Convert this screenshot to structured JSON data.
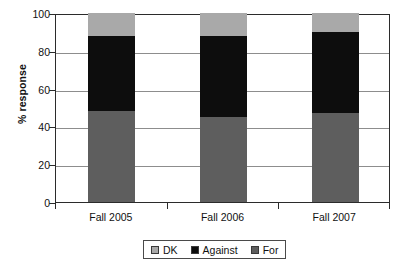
{
  "chart_data": {
    "type": "bar",
    "stacked": true,
    "title": "",
    "xlabel": "",
    "ylabel": "% response",
    "ylim": [
      0,
      100
    ],
    "yticks": [
      0,
      20,
      40,
      60,
      80,
      100
    ],
    "grid": true,
    "legend_position": "bottom",
    "categories": [
      "Fall 2005",
      "Fall 2006",
      "Fall 2007"
    ],
    "series": [
      {
        "name": "For",
        "color": "#5e5e5e",
        "values": [
          48,
          45,
          47
        ]
      },
      {
        "name": "Against",
        "color": "#0d0d0d",
        "values": [
          40,
          43,
          43
        ]
      },
      {
        "name": "DK",
        "color": "#a9a9a9",
        "values": [
          12,
          12,
          10
        ]
      }
    ],
    "stack_order_bottom_to_top": [
      "For",
      "Against",
      "DK"
    ]
  },
  "axes": {
    "y_title": "% response",
    "y_tick_labels": [
      "100",
      "80",
      "60",
      "40",
      "20",
      "0"
    ],
    "x_tick_labels": [
      "Fall 2005",
      "Fall 2006",
      "Fall 2007"
    ]
  },
  "legend": {
    "entries": [
      {
        "label": "DK",
        "color": "#a9a9a9"
      },
      {
        "label": "Against",
        "color": "#0d0d0d"
      },
      {
        "label": "For",
        "color": "#5e5e5e"
      }
    ]
  }
}
